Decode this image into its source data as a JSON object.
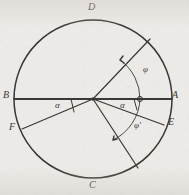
{
  "figure": {
    "background_color": "#eceae6",
    "ink_color": "#3a3734",
    "width": 189,
    "height": 195
  },
  "circle": {
    "center_x": 93,
    "center_y": 99,
    "radius": 79
  },
  "points": [
    {
      "id": "D",
      "label": "D",
      "x": 93,
      "y": 20,
      "label_x": 88,
      "label_y": 2,
      "position": "top"
    },
    {
      "id": "A",
      "label": "A",
      "x": 172,
      "y": 99,
      "label_x": 172,
      "label_y": 90,
      "position": "right"
    },
    {
      "id": "E",
      "label": "E",
      "x": 164,
      "y": 125,
      "label_x": 168,
      "label_y": 121,
      "position": "lower-right"
    },
    {
      "id": "C",
      "label": "C",
      "x": 93,
      "y": 178,
      "label_x": 89,
      "label_y": 180,
      "position": "bottom"
    },
    {
      "id": "F",
      "label": "F",
      "x": 22,
      "y": 129,
      "label_x": 10,
      "label_y": 125,
      "position": "lower-left"
    },
    {
      "id": "B",
      "label": "B",
      "x": 14,
      "y": 99,
      "label_x": 3,
      "label_y": 90,
      "position": "left"
    }
  ],
  "angles": [
    {
      "id": "alpha-left",
      "label": "α",
      "label_x": 56,
      "label_y": 104
    },
    {
      "id": "alpha-right",
      "label": "α",
      "label_x": 121,
      "label_y": 104
    },
    {
      "id": "phi",
      "label": "φ",
      "label_x": 144,
      "label_y": 70
    },
    {
      "id": "phi-prime",
      "label": "φ'",
      "label_x": 136,
      "label_y": 126
    }
  ],
  "arcs": [
    {
      "id": "phi-arc",
      "note": "arc with arrowhead from radius OA up to upper-right radius"
    },
    {
      "id": "phi-prime-arc",
      "note": "arc with arrowhead from chord OE down to lower-right radius"
    }
  ],
  "markers": [
    {
      "id": "center-dot",
      "x": 93,
      "y": 99
    },
    {
      "id": "arc-node-on-ba",
      "x": 140,
      "y": 99
    }
  ]
}
